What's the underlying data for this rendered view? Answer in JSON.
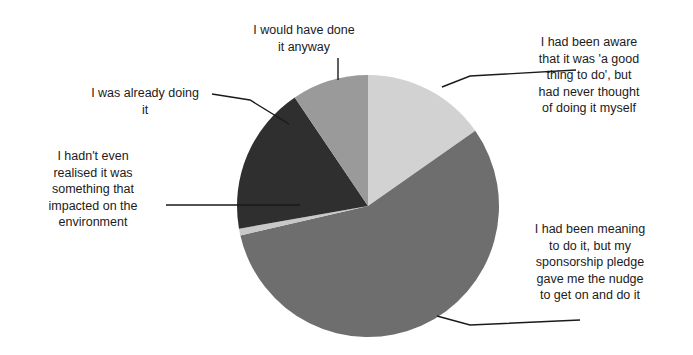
{
  "chart_data": {
    "type": "pie",
    "title": "",
    "subtitle": "",
    "xlabel": "",
    "ylabel": "",
    "grid": false,
    "legend_position": "callout-labels",
    "center": {
      "x": 368,
      "y": 206
    },
    "radius": 131,
    "start_angle_deg": 0,
    "direction": "clockwise",
    "categories": [
      "I had been aware that it was 'a good thing to do', but had never thought of doing it myself",
      "I had been meaning to do it, but my sponsorship pledge gave me the nudge to get on and do it",
      "I hadn't even realised it was something that impacted on the environment",
      "I was already doing it",
      "I would have done it anyway"
    ],
    "values": [
      15.3,
      56.1,
      0.8,
      18.3,
      9.5
    ],
    "colors": [
      "#d2d2d2",
      "#6e6e6e",
      "#c8c8c8",
      "#2f2f2f",
      "#9a9a9a"
    ],
    "slices": [
      {
        "label": "I had been aware that it was 'a good thing to do', but had never thought of doing it myself",
        "value": 15.3,
        "start_angle_deg": 0,
        "end_angle_deg": 55,
        "color": "#d2d2d2"
      },
      {
        "label": "I had been meaning to do it, but my sponsorship pledge gave me the nudge to get on and do it",
        "value": 56.1,
        "start_angle_deg": 55,
        "end_angle_deg": 257,
        "color": "#6e6e6e"
      },
      {
        "label": "I hadn't even realised it was something that impacted on the environment",
        "value": 0.8,
        "start_angle_deg": 257,
        "end_angle_deg": 260,
        "color": "#c8c8c8"
      },
      {
        "label": "I was already doing it",
        "value": 18.3,
        "start_angle_deg": 260,
        "end_angle_deg": 326,
        "color": "#2f2f2f"
      },
      {
        "label": "I would have done it anyway",
        "value": 9.5,
        "start_angle_deg": 326,
        "end_angle_deg": 360,
        "color": "#9a9a9a"
      }
    ]
  },
  "labels": {
    "aware": "I had been aware\nthat it was 'a good\nthing to do', but\nhad never thought\nof doing it myself",
    "meaning": "I had been meaning\nto do it, but my\nsponsorship pledge\ngave me the nudge\nto get on and do it",
    "already_doing": "I was already doing\nit",
    "would_have_done": "I would have done\nit anyway",
    "not_realised": "I hadn't even\nrealised it was\nsomething that\nimpacted on the\nenvironment"
  }
}
